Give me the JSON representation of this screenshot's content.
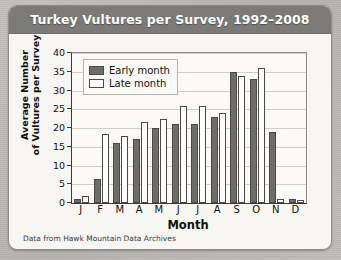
{
  "card": {
    "title": "Turkey Vultures per Survey, 1992–2008",
    "source_note": "Data from Hawk Mountain Data Archives"
  },
  "colors": {
    "title_bar": "#7b7a77",
    "title_text": "#ffffff",
    "card_bg": "#f7f6f2",
    "plot_bg": "#fbfaf7",
    "early_fill": "#6e6d6a",
    "late_fill": "#ffffff",
    "bar_outline": "#4a4946",
    "gridline": "#cfcdc8",
    "axis": "#3a3a3a"
  },
  "legend": {
    "position": "top-left-inside",
    "entries": [
      {
        "label": "Early month",
        "style": "filled-dark"
      },
      {
        "label": "Late month",
        "style": "outlined-white"
      }
    ]
  },
  "chart_data": {
    "type": "bar",
    "title": "Turkey Vultures per Survey, 1992–2008",
    "xlabel": "Month",
    "ylabel": "Average Number of Vultures per Survey",
    "ylabel_lines": [
      "Average Number",
      "of Vultures per Survey"
    ],
    "categories": [
      "J",
      "F",
      "M",
      "A",
      "M",
      "J",
      "J",
      "A",
      "S",
      "O",
      "N",
      "D"
    ],
    "series": [
      {
        "name": "Early month",
        "values": [
          1,
          6.5,
          16,
          17,
          20,
          21,
          21,
          23,
          35,
          33,
          19,
          1
        ]
      },
      {
        "name": "Late month",
        "values": [
          2,
          18.5,
          18,
          21.5,
          22.5,
          26,
          26,
          24,
          34,
          36,
          1,
          0.7
        ]
      }
    ],
    "ylim": [
      0,
      40
    ],
    "yticks": [
      0,
      5,
      10,
      15,
      20,
      25,
      30,
      35,
      40
    ],
    "grid": true,
    "legend_entries": [
      "Early month",
      "Late month"
    ],
    "annotation": "Data from Hawk Mountain Data Archives"
  }
}
